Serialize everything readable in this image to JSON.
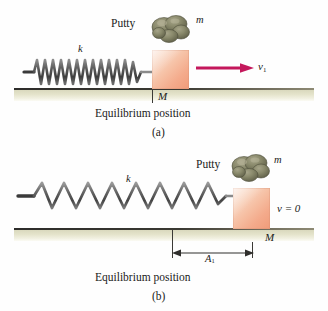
{
  "figure": {
    "type": "physics-diagram",
    "colors": {
      "spring": "#6b6b6b",
      "block": "#f4ab8c",
      "putty": "#7e7e62",
      "ground": "#e4e3cb",
      "ground_line": "#2d2c2a",
      "velocity_arrow": "#c4185c",
      "text": "#1b1b20"
    }
  },
  "panel_a": {
    "letter": "(a)",
    "caption": "Equilibrium position",
    "putty_label": "Putty",
    "putty_mass_label": "m",
    "spring_constant_label": "k",
    "block_mass_label": "M",
    "velocity_label": "v",
    "velocity_subscript": "1",
    "spring_state": "compressed"
  },
  "panel_b": {
    "letter": "(b)",
    "caption": "Equilibrium position",
    "putty_label": "Putty",
    "putty_mass_label": "m",
    "spring_constant_label": "k",
    "block_mass_label": "M",
    "velocity_label": "v = 0",
    "amplitude_label": "A",
    "amplitude_subscript": "1",
    "spring_state": "stretched"
  }
}
